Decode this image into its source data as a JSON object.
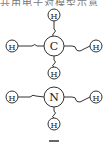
{
  "caption": "共用电子对模型示意",
  "molecules": [
    {
      "name": "methane",
      "center": {
        "label": "C",
        "x": 54,
        "y": 46,
        "r": 10
      },
      "hydrogens": [
        {
          "label": "H",
          "x": 54,
          "y": 15
        },
        {
          "label": "H",
          "x": 12,
          "y": 46
        },
        {
          "label": "H",
          "x": 96,
          "y": 46
        },
        {
          "label": "H",
          "x": 54,
          "y": 73
        }
      ]
    },
    {
      "name": "ammonia",
      "center": {
        "label": "N",
        "x": 54,
        "y": 97,
        "r": 10
      },
      "hydrogens": [
        {
          "label": "H",
          "x": 12,
          "y": 97
        },
        {
          "label": "H",
          "x": 96,
          "y": 97
        },
        {
          "label": "H",
          "x": 54,
          "y": 124
        }
      ]
    }
  ],
  "colors": {
    "stroke": "#333333",
    "text": "#222222"
  }
}
